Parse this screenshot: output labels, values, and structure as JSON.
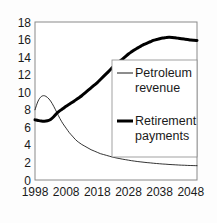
{
  "chart_data": {
    "type": "line",
    "title": "",
    "subtitle": "",
    "xlabel": "",
    "ylabel": "",
    "xlim": [
      1998,
      2050
    ],
    "ylim": [
      0,
      18
    ],
    "grid": false,
    "legend_position": "center-right inside plot",
    "x_ticks": [
      "1998",
      "2008",
      "2018",
      "2028",
      "2038",
      "2048"
    ],
    "x_tick_values": [
      1998,
      2008,
      2018,
      2028,
      2038,
      2048
    ],
    "y_ticks": [
      "0",
      "2",
      "4",
      "6",
      "8",
      "10",
      "12",
      "14",
      "16",
      "18"
    ],
    "y_tick_values": [
      0,
      2,
      4,
      6,
      8,
      10,
      12,
      14,
      16,
      18
    ],
    "x": [
      1998,
      1999,
      2000,
      2001,
      2002,
      2003,
      2004,
      2005,
      2006,
      2007,
      2008,
      2009,
      2010,
      2011,
      2012,
      2013,
      2014,
      2015,
      2016,
      2017,
      2018,
      2019,
      2020,
      2021,
      2022,
      2023,
      2024,
      2025,
      2026,
      2027,
      2028,
      2029,
      2030,
      2031,
      2032,
      2033,
      2034,
      2035,
      2036,
      2037,
      2038,
      2039,
      2040,
      2041,
      2042,
      2043,
      2044,
      2045,
      2046,
      2047,
      2048,
      2049,
      2050
    ],
    "series": [
      {
        "name": "Petroleum revenue",
        "line_style": "thin",
        "color": "#000000",
        "line_width": 0.8,
        "values": [
          8.0,
          9.0,
          9.5,
          9.6,
          9.4,
          9.0,
          8.4,
          7.7,
          7.0,
          6.4,
          5.9,
          5.4,
          5.0,
          4.6,
          4.3,
          4.05,
          3.85,
          3.65,
          3.45,
          3.3,
          3.15,
          3.0,
          2.9,
          2.8,
          2.7,
          2.6,
          2.52,
          2.45,
          2.38,
          2.32,
          2.26,
          2.2,
          2.15,
          2.1,
          2.06,
          2.02,
          1.98,
          1.95,
          1.91,
          1.88,
          1.85,
          1.82,
          1.8,
          1.77,
          1.75,
          1.73,
          1.71,
          1.69,
          1.68,
          1.66,
          1.65,
          1.64,
          1.63
        ]
      },
      {
        "name": "Retirement payments",
        "line_style": "thick",
        "color": "#000000",
        "line_width": 3.0,
        "values": [
          6.85,
          6.78,
          6.72,
          6.7,
          6.75,
          6.9,
          7.2,
          7.6,
          7.9,
          8.15,
          8.4,
          8.62,
          8.85,
          9.1,
          9.35,
          9.6,
          9.9,
          10.2,
          10.5,
          10.8,
          11.1,
          11.45,
          11.8,
          12.15,
          12.5,
          12.85,
          13.15,
          13.45,
          13.75,
          14.05,
          14.35,
          14.6,
          14.85,
          15.05,
          15.25,
          15.45,
          15.6,
          15.75,
          15.9,
          16.0,
          16.1,
          16.18,
          16.22,
          16.25,
          16.24,
          16.2,
          16.15,
          16.1,
          16.05,
          16.0,
          15.95,
          15.92,
          15.9
        ]
      }
    ],
    "annotations": []
  },
  "legend": {
    "entries": [
      {
        "label_line1": "Petroleum",
        "label_line2": "revenue",
        "swatch": "thin-line-swatch"
      },
      {
        "label_line1": "Retirement",
        "label_line2": "payments",
        "swatch": "thick-line-swatch"
      }
    ]
  },
  "colors": {
    "axis": "#808080",
    "line": "#000000",
    "text": "#1a1a1a",
    "background": "#fdfdfd"
  }
}
